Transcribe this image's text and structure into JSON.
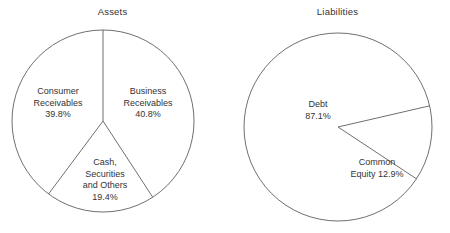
{
  "figure": {
    "width": 450,
    "height": 233,
    "background": "#ffffff",
    "stroke_color": "#4a4a4a",
    "text_color": "#333333"
  },
  "chart_data": [
    {
      "type": "pie",
      "title": "Assets",
      "xlabel": "",
      "ylabel": "",
      "legend": "none",
      "grid": false,
      "start_angle_deg": 0,
      "direction": "clockwise",
      "center": {
        "x": 103,
        "y": 121
      },
      "radius": 91,
      "categories": [
        "Business Receivables",
        "Cash, Securities and Others",
        "Consumer Receivables"
      ],
      "values": [
        40.8,
        19.4,
        39.8
      ],
      "units": "percent",
      "slices": [
        {
          "label": "Business Receivables",
          "label_lines": [
            "Business",
            "Receivables",
            "40.8%"
          ],
          "value": 40.8,
          "value_text": "40.8%",
          "label_x": 148,
          "label_y": 103
        },
        {
          "label": "Cash, Securities and Others",
          "label_lines": [
            "Cash,",
            "Securities",
            "and Others",
            "19.4%"
          ],
          "value": 19.4,
          "value_text": "19.4%",
          "label_x": 105,
          "label_y": 180
        },
        {
          "label": "Consumer Receivables",
          "label_lines": [
            "Consumer",
            "Receivables",
            "39.8%"
          ],
          "value": 39.8,
          "value_text": "39.8%",
          "label_x": 58,
          "label_y": 103
        }
      ]
    },
    {
      "type": "pie",
      "title": "Liabilities",
      "xlabel": "",
      "ylabel": "",
      "legend": "none",
      "grid": false,
      "start_angle_deg": 77,
      "direction": "clockwise",
      "center": {
        "x": 113,
        "y": 127
      },
      "radius": 94,
      "categories": [
        "Common Equity",
        "Debt"
      ],
      "values": [
        12.9,
        87.1
      ],
      "units": "percent",
      "slices": [
        {
          "label": "Common Equity",
          "label_lines": [
            "Common",
            "Equity 12.9%"
          ],
          "value": 12.9,
          "value_text": "12.9%",
          "label_x": 152,
          "label_y": 168
        },
        {
          "label": "Debt",
          "label_lines": [
            "Debt",
            "87.1%"
          ],
          "value": 87.1,
          "value_text": "87.1%",
          "label_x": 93,
          "label_y": 110
        }
      ]
    }
  ],
  "footnote": {
    "text": ""
  }
}
